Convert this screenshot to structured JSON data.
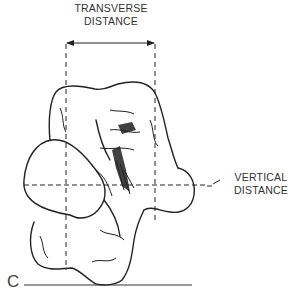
{
  "figure": {
    "panel_label": "C",
    "labels": {
      "transverse_line1": "TRANSVERSE",
      "transverse_line2": "DISTANCE",
      "vertical_line1": "VERTICAL",
      "vertical_line2": "DISTANCE"
    },
    "measurements": [
      {
        "name": "transverse distance",
        "orientation": "horizontal",
        "from_x": 66,
        "to_x": 155,
        "y": 42
      },
      {
        "name": "vertical distance",
        "orientation": "horizontal-reference",
        "y": 185
      }
    ],
    "colors": {
      "line": "#222222",
      "background": "#ffffff"
    }
  }
}
